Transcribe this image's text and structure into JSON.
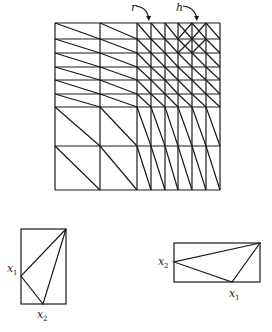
{
  "mesh": {
    "x_lines": [
      55,
      100,
      137,
      151,
      165,
      178,
      192,
      206,
      220
    ],
    "y_lines": [
      23,
      39,
      53,
      67,
      80,
      94,
      107,
      146,
      190
    ],
    "crossed_cells": [
      [
        5,
        0
      ],
      [
        6,
        0
      ],
      [
        5,
        1
      ],
      [
        6,
        1
      ]
    ],
    "labels": {
      "r": {
        "text": "r",
        "x": 131,
        "y": 11,
        "arrow_to": [
          149,
          21
        ]
      },
      "h": {
        "text": "h",
        "x": 176,
        "y": 11,
        "arrow_to": [
          197,
          21
        ]
      }
    }
  },
  "triangle_left": {
    "rect": {
      "x": 21,
      "y": 229,
      "w": 45,
      "h": 75
    },
    "x1_label": {
      "base": "x",
      "sub": "1"
    },
    "x2_label": {
      "base": "x",
      "sub": "2"
    }
  },
  "triangle_right": {
    "rect": {
      "x": 174,
      "y": 243,
      "w": 86,
      "h": 39
    },
    "x1_label": {
      "base": "x",
      "sub": "1"
    },
    "x2_label": {
      "base": "x",
      "sub": "2"
    }
  }
}
